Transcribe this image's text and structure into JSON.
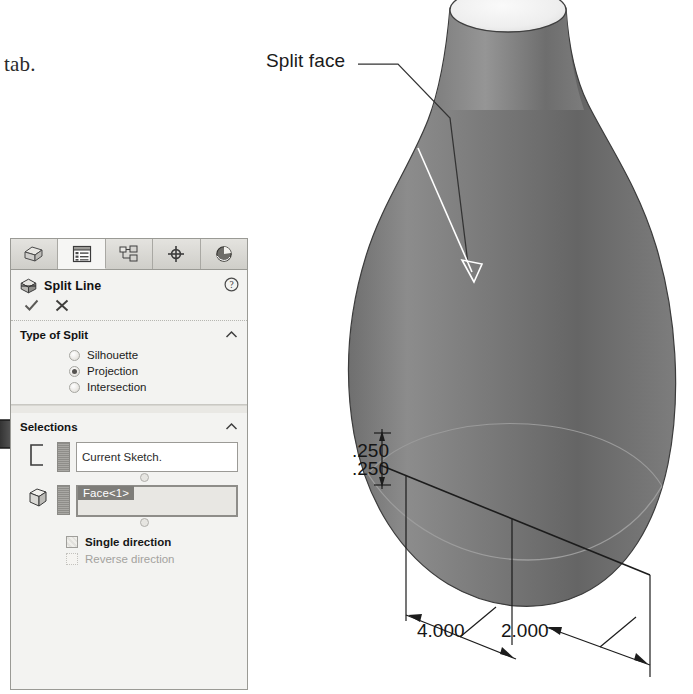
{
  "book": {
    "fragment_text": "tab."
  },
  "annotation": {
    "label": "Split face",
    "leader_color": "#3a3a3a"
  },
  "model": {
    "name": "bottle-solid-body",
    "surface_color_light": "#8e8e8e",
    "surface_color_dark": "#5a5a5a",
    "opening_color": "#efefef",
    "outline_color": "#3c3c3c"
  },
  "dimensions": [
    {
      "name": "height-offset",
      "value": ".250"
    },
    {
      "name": "length-a",
      "value": "4.000"
    },
    {
      "name": "length-b",
      "value": "2.000"
    }
  ],
  "pointer_arrow": {
    "name": "instruction-arrow",
    "points_to": "Projection"
  },
  "property_manager": {
    "tabs": [
      {
        "key": "feature-manager",
        "icon": "feature-tree-icon",
        "active": false
      },
      {
        "key": "property-manager",
        "icon": "property-list-icon",
        "active": true
      },
      {
        "key": "configuration-manager",
        "icon": "configuration-icon",
        "active": false
      },
      {
        "key": "dimxpert-manager",
        "icon": "crosshair-target-icon",
        "active": false
      },
      {
        "key": "display-manager",
        "icon": "appearance-sphere-icon",
        "active": false
      }
    ],
    "title": "Split Line",
    "title_icon": "split-line-icon",
    "help_icon": "help-question-icon",
    "confirm": {
      "ok_icon": "checkmark-icon",
      "cancel_icon": "close-x-icon"
    },
    "sections": [
      {
        "key": "type-of-split",
        "heading": "Type of Split",
        "collapse_icon": "chevron-up-icon",
        "options": [
          {
            "label": "Silhouette",
            "selected": false
          },
          {
            "label": "Projection",
            "selected": true
          },
          {
            "label": "Intersection",
            "selected": false
          }
        ]
      },
      {
        "key": "selections",
        "heading": "Selections",
        "collapse_icon": "chevron-up-icon",
        "sketch_field": {
          "icon": "sketch-region-icon",
          "value": "Current Sketch."
        },
        "faces_field": {
          "icon": "face-cube-icon",
          "items": [
            "Face<1>"
          ]
        },
        "checkboxes": [
          {
            "label": "Single direction",
            "checked": false,
            "enabled": true
          },
          {
            "label": "Reverse direction",
            "checked": false,
            "enabled": false
          }
        ]
      }
    ]
  }
}
